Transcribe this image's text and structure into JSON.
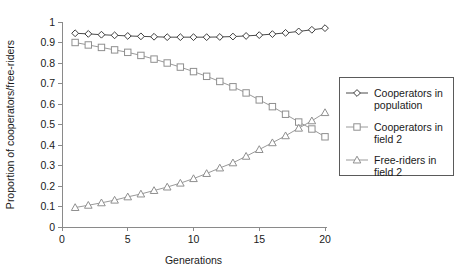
{
  "chart_data": {
    "type": "line",
    "title": "",
    "xlabel": "Generations",
    "ylabel": "Proportion of cooperators/free-riders",
    "xlim": [
      0,
      20
    ],
    "ylim": [
      0,
      1
    ],
    "grid": false,
    "legend_position": "right",
    "x_ticks": [
      "0",
      "5",
      "10",
      "15",
      "20"
    ],
    "x_tick_values": [
      0,
      5,
      10,
      15,
      20
    ],
    "y_ticks": [
      "0",
      "0.1",
      "0.2",
      "0.3",
      "0.4",
      "0.5",
      "0.6",
      "0.7",
      "0.8",
      "0.9",
      "1"
    ],
    "y_tick_values": [
      0,
      0.1,
      0.2,
      0.3,
      0.4,
      0.5,
      0.6,
      0.7,
      0.8,
      0.9,
      1
    ],
    "x": [
      1,
      2,
      3,
      4,
      5,
      6,
      7,
      8,
      9,
      10,
      11,
      12,
      13,
      14,
      15,
      16,
      17,
      18,
      19,
      20
    ],
    "series": [
      {
        "name": "Cooperators in population",
        "marker": "diamond",
        "color": "#3d3d3d",
        "values": [
          0.945,
          0.942,
          0.938,
          0.935,
          0.932,
          0.93,
          0.928,
          0.926,
          0.926,
          0.926,
          0.926,
          0.927,
          0.929,
          0.932,
          0.936,
          0.941,
          0.947,
          0.954,
          0.962,
          0.97
        ]
      },
      {
        "name": "Cooperators in field 2",
        "marker": "square",
        "color": "#8f8f8f",
        "values": [
          0.9,
          0.888,
          0.876,
          0.864,
          0.852,
          0.837,
          0.819,
          0.8,
          0.78,
          0.758,
          0.735,
          0.71,
          0.684,
          0.654,
          0.62,
          0.587,
          0.55,
          0.512,
          0.478,
          0.44
        ]
      },
      {
        "name": "Free-riders in field 2",
        "marker": "triangle",
        "color": "#8f8f8f",
        "values": [
          0.095,
          0.106,
          0.118,
          0.131,
          0.147,
          0.161,
          0.178,
          0.195,
          0.214,
          0.236,
          0.261,
          0.288,
          0.313,
          0.345,
          0.378,
          0.411,
          0.445,
          0.482,
          0.518,
          0.558
        ]
      }
    ]
  },
  "legend": {
    "entries": [
      {
        "label_line1": "Cooperators in",
        "label_line2": "population"
      },
      {
        "label_line1": "Cooperators in",
        "label_line2": "field 2"
      },
      {
        "label_line1": "Free-riders in",
        "label_line2": "field 2"
      }
    ]
  }
}
